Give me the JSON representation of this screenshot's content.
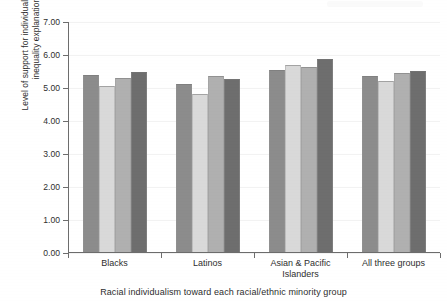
{
  "chart_data": {
    "type": "bar",
    "title": "",
    "subtitle": "",
    "xlabel": "Racial individualism toward each racial/ethnic minority group",
    "ylabel": "Level of support for individualistic racial\ninequality explanations",
    "categories": [
      "Blacks",
      "Latinos",
      "Asian & Pacific\nIslanders",
      "All three groups"
    ],
    "ylim": [
      0.0,
      7.0
    ],
    "ytick_labels": [
      "0.00",
      "1.00",
      "2.00",
      "3.00",
      "4.00",
      "5.00",
      "6.00",
      "7.00"
    ],
    "ytick_values": [
      0.0,
      1.0,
      2.0,
      3.0,
      4.0,
      5.0,
      6.0,
      7.0
    ],
    "grid": false,
    "legend": "none",
    "series": [
      {
        "name": "series-1",
        "color": "#8c8c8c",
        "values": [
          5.35,
          5.08,
          5.53,
          5.32
        ]
      },
      {
        "name": "series-2",
        "color": "#d9d9d9",
        "values": [
          5.02,
          4.8,
          5.66,
          5.18
        ]
      },
      {
        "name": "series-3",
        "color": "#b0b0b0",
        "values": [
          5.26,
          5.33,
          5.62,
          5.41
        ]
      },
      {
        "name": "series-4",
        "color": "#6e6e6e",
        "values": [
          5.45,
          5.25,
          5.86,
          5.5
        ]
      }
    ]
  }
}
